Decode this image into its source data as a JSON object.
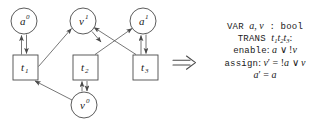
{
  "figure": {
    "kind": "petri-net-to-smv",
    "implies_symbol": "⟹"
  },
  "graph": {
    "places": [
      {
        "id": "a0",
        "base": "a",
        "sup": "0",
        "cx": 24,
        "cy": 21,
        "r": 13
      },
      {
        "id": "v1",
        "base": "v",
        "sup": "1",
        "cx": 83,
        "cy": 21,
        "r": 13
      },
      {
        "id": "a1",
        "base": "a",
        "sup": "1",
        "cx": 143,
        "cy": 21,
        "r": 13
      },
      {
        "id": "v0",
        "base": "v",
        "sup": "0",
        "cx": 84,
        "cy": 105,
        "r": 13
      }
    ],
    "transitions": [
      {
        "id": "t1",
        "base": "t",
        "sub": "1",
        "x": 13,
        "y": 55,
        "w": 25,
        "h": 25
      },
      {
        "id": "t2",
        "base": "t",
        "sub": "2",
        "x": 73,
        "y": 55,
        "w": 25,
        "h": 25
      },
      {
        "id": "t3",
        "base": "t",
        "sub": "3",
        "x": 133,
        "y": 55,
        "w": 25,
        "h": 25
      }
    ],
    "edges": [
      {
        "from": "t1",
        "to": "a0",
        "type": "double-vertical"
      },
      {
        "from": "t1",
        "to": "v1",
        "type": "diagonal-up-right"
      },
      {
        "from": "t2",
        "to": "a1",
        "type": "diagonal-up-right-cross"
      },
      {
        "from": "t3",
        "to": "v1",
        "type": "diagonal-up-left-cross"
      },
      {
        "from": "t3",
        "to": "a1",
        "type": "double-vertical"
      },
      {
        "from": "t2",
        "to": "v0",
        "type": "double-vertical"
      },
      {
        "from": "v0",
        "to": "t1",
        "type": "diagonal-up-left"
      }
    ]
  },
  "code": {
    "lines": [
      {
        "id": "var-line",
        "parts": [
          {
            "cls": "kw",
            "text": "VAR "
          },
          {
            "cls": "it",
            "text": "a"
          },
          {
            "cls": "op",
            "text": ", "
          },
          {
            "cls": "it",
            "text": "v"
          },
          {
            "cls": "kw",
            "text": " : bool"
          }
        ]
      },
      {
        "id": "trans-line",
        "parts": [
          {
            "cls": "kw",
            "text": "TRANS "
          },
          {
            "cls": "it",
            "text": "t"
          },
          {
            "cls": "sub",
            "text": "1"
          },
          {
            "cls": "it",
            "text": "t"
          },
          {
            "cls": "sub",
            "text": "2"
          },
          {
            "cls": "it",
            "text": "t"
          },
          {
            "cls": "sub",
            "text": "3"
          },
          {
            "cls": "op",
            "text": ":"
          }
        ]
      },
      {
        "id": "enable-line",
        "parts": [
          {
            "cls": "kw",
            "text": "enable"
          },
          {
            "cls": "op",
            "text": ": "
          },
          {
            "cls": "it",
            "text": "a"
          },
          {
            "cls": "op",
            "text": " ∨ "
          },
          {
            "cls": "op",
            "text": "!"
          },
          {
            "cls": "it",
            "text": "v"
          }
        ]
      },
      {
        "id": "assign-line",
        "parts": [
          {
            "cls": "kw",
            "text": "assign"
          },
          {
            "cls": "op",
            "text": ": "
          },
          {
            "cls": "it",
            "text": "v"
          },
          {
            "cls": "prime",
            "text": "′"
          },
          {
            "cls": "op",
            "text": " = "
          },
          {
            "cls": "op",
            "text": "!"
          },
          {
            "cls": "it",
            "text": "a"
          },
          {
            "cls": "op",
            "text": " ∨ "
          },
          {
            "cls": "it",
            "text": "v"
          }
        ]
      },
      {
        "id": "assign-line-2",
        "parts": [
          {
            "cls": "it",
            "text": "a"
          },
          {
            "cls": "prime",
            "text": "′"
          },
          {
            "cls": "op",
            "text": " = "
          },
          {
            "cls": "it",
            "text": "a"
          }
        ]
      }
    ],
    "plain_text": "VAR a, v : bool  TRANS t1t2t3:  enable: a ∨ !v  assign: v' = !a ∨ v  a' = a"
  },
  "colors": {
    "stroke": "#4a4a4a",
    "text": "#1a1a1a",
    "background": "#ffffff"
  }
}
